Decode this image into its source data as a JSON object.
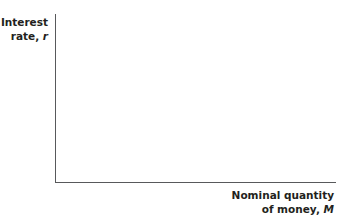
{
  "chart_data": {
    "type": "line",
    "title": "",
    "ylabel": "Interest rate, r",
    "xlabel": "Nominal quantity of money, M",
    "series": [],
    "grid": false,
    "legend": null
  },
  "labels": {
    "y_line1": "Interest",
    "y_line2_text": "rate, ",
    "y_var": "r",
    "x_line1": "Nominal quantity",
    "x_line2_text": "of money, ",
    "x_var": "M"
  }
}
